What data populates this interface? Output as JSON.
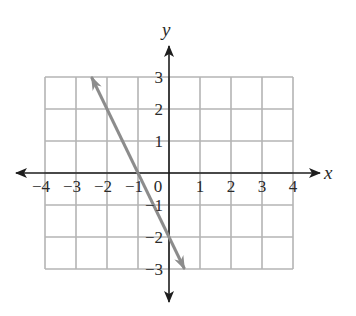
{
  "chart_data": {
    "type": "line",
    "title": "",
    "xlabel": "x",
    "ylabel": "y",
    "xlim": [
      -4,
      4
    ],
    "ylim": [
      -3,
      3
    ],
    "grid": true,
    "x_ticks": [
      -4,
      -3,
      -2,
      -1,
      0,
      1,
      2,
      3,
      4
    ],
    "x_tick_labels": [
      "−4",
      "−3",
      "−2",
      "−1",
      "0",
      "1",
      "2",
      "3",
      "4"
    ],
    "y_ticks": [
      3,
      2,
      1,
      -1,
      -2,
      -3
    ],
    "y_tick_labels": [
      "3",
      "2",
      "1",
      "−1",
      "−2",
      "−3"
    ],
    "series": [
      {
        "name": "line",
        "equation": "y = -2x - 2",
        "x": [
          -2.5,
          -1,
          0,
          0.5
        ],
        "y": [
          3,
          0,
          -2,
          -3
        ],
        "arrows_both_ends": true,
        "color": "#8c8c8c"
      }
    ],
    "legend": null
  },
  "colors": {
    "grid": "#b4b4b4",
    "axis": "#1e1e1e",
    "line": "#8c8c8c",
    "text": "#2a2a2a"
  }
}
